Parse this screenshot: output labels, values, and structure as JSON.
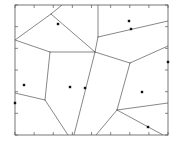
{
  "figure": {
    "title": "",
    "background_color": "#ffffff",
    "width": 182,
    "height": 147
  },
  "axes": {
    "frame_color": "#555555",
    "frame_line_width": 0.8,
    "tick_color": "#555555",
    "tick_length": 3,
    "tick_line_width": 0.7,
    "x_tick_count": 9,
    "y_tick_count": 7,
    "x_tick_labels": [],
    "y_tick_labels": [],
    "xlabel": "",
    "ylabel": "",
    "grid": false,
    "frame": {
      "left": 15,
      "top": 5,
      "right": 168,
      "bottom": 135
    }
  },
  "chart_data": {
    "type": "scatter",
    "title": "",
    "xlabel": "",
    "ylabel": "",
    "xlim": [
      15,
      168
    ],
    "ylim": [
      5,
      135
    ],
    "grid": false,
    "legend": null,
    "diagram_kind": "voronoi-tessellation",
    "point_marker": {
      "shape": "square",
      "size": 2.4,
      "color": "#111111"
    },
    "edge_style": {
      "color": "#555555",
      "width": 0.7
    },
    "points": [
      {
        "id": "p1",
        "x": 58,
        "y": 24
      },
      {
        "id": "p2",
        "x": 129,
        "y": 21
      },
      {
        "id": "p3",
        "x": 131,
        "y": 29
      },
      {
        "id": "p4",
        "x": 24,
        "y": 85
      },
      {
        "id": "p5",
        "x": 70,
        "y": 87
      },
      {
        "id": "p6",
        "x": 85,
        "y": 88
      },
      {
        "id": "p7",
        "x": 142,
        "y": 92
      },
      {
        "id": "p8",
        "x": 148,
        "y": 127
      },
      {
        "id": "p9",
        "x": 15,
        "y": 103
      },
      {
        "id": "p10",
        "x": 168,
        "y": 62
      }
    ],
    "edges": [
      {
        "id": "e1",
        "x1": 15,
        "y1": 40,
        "x2": 51,
        "y2": 14
      },
      {
        "id": "e2",
        "x1": 51,
        "y1": 14,
        "x2": 62,
        "y2": 5
      },
      {
        "id": "e3",
        "x1": 51,
        "y1": 14,
        "x2": 95,
        "y2": 52
      },
      {
        "id": "e4",
        "x1": 95,
        "y1": 52,
        "x2": 98,
        "y2": 37
      },
      {
        "id": "e5",
        "x1": 98,
        "y1": 37,
        "x2": 98,
        "y2": 5
      },
      {
        "id": "e6",
        "x1": 98,
        "y1": 37,
        "x2": 168,
        "y2": 21
      },
      {
        "id": "e7",
        "x1": 15,
        "y1": 40,
        "x2": 50,
        "y2": 52
      },
      {
        "id": "e8",
        "x1": 50,
        "y1": 52,
        "x2": 95,
        "y2": 52
      },
      {
        "id": "e9",
        "x1": 50,
        "y1": 52,
        "x2": 45,
        "y2": 100
      },
      {
        "id": "e10",
        "x1": 45,
        "y1": 100,
        "x2": 15,
        "y2": 93
      },
      {
        "id": "e11",
        "x1": 45,
        "y1": 100,
        "x2": 68,
        "y2": 135
      },
      {
        "id": "e12",
        "x1": 95,
        "y1": 52,
        "x2": 74,
        "y2": 135
      },
      {
        "id": "e13",
        "x1": 95,
        "y1": 52,
        "x2": 130,
        "y2": 63
      },
      {
        "id": "e14",
        "x1": 130,
        "y1": 63,
        "x2": 168,
        "y2": 46
      },
      {
        "id": "e15",
        "x1": 130,
        "y1": 63,
        "x2": 117,
        "y2": 110
      },
      {
        "id": "e16",
        "x1": 117,
        "y1": 110,
        "x2": 96,
        "y2": 135
      },
      {
        "id": "e17",
        "x1": 117,
        "y1": 110,
        "x2": 168,
        "y2": 103
      },
      {
        "id": "e18",
        "x1": 117,
        "y1": 110,
        "x2": 163,
        "y2": 135
      }
    ]
  }
}
